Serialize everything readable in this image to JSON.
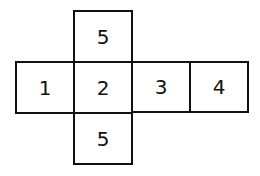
{
  "diagram": {
    "type": "cube-net",
    "faces": {
      "top": "5",
      "left": "1",
      "center": "2",
      "right": "3",
      "far_right": "4",
      "bottom": "5"
    }
  }
}
